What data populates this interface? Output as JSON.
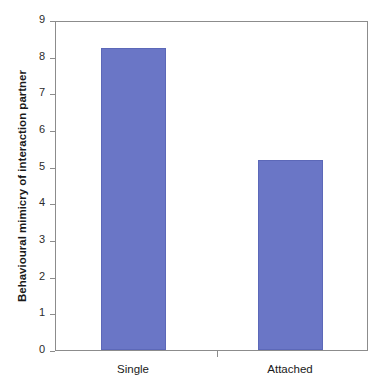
{
  "chart_data": {
    "type": "bar",
    "title": "",
    "subtitle": "",
    "xlabel": "",
    "ylabel": "Behavioural mimicry of interaction partner",
    "categories": [
      "Single",
      "Attached"
    ],
    "values": [
      8.3,
      5.2
    ],
    "series": [
      {
        "name": "Behavioural mimicry",
        "values": [
          8.3,
          5.2
        ]
      }
    ],
    "ylim": [
      0,
      9
    ],
    "ytick_labels": [
      "0",
      "1",
      "2",
      "3",
      "4",
      "5",
      "6",
      "7",
      "8",
      "9"
    ],
    "ytick_values": [
      0,
      1,
      2,
      3,
      4,
      5,
      6,
      7,
      8,
      9
    ],
    "grid": false,
    "legend": false,
    "legend_position": "none",
    "bar_color": "#6a76c6",
    "bar_edge_color": "#5c68b8",
    "axis_color": "#8c8c8c",
    "background_color": "#ffffff",
    "text_color": "#1a1a1a",
    "annotations": []
  }
}
